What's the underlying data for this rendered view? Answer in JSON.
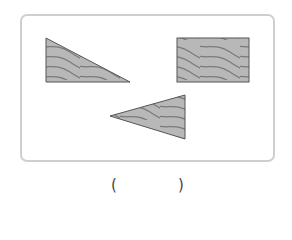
{
  "figure": {
    "shapes": [
      {
        "id": "shape-1",
        "kind": "right-triangle",
        "texture": "wood-grain"
      },
      {
        "id": "shape-2",
        "kind": "rectangle",
        "texture": "wood-grain"
      },
      {
        "id": "shape-3",
        "kind": "triangle",
        "texture": "wood-grain"
      }
    ],
    "colors": {
      "fill": "#b8b8b8",
      "grain": "#7a7a7a",
      "outline": "#555555",
      "frame": "#cfcfcf"
    }
  },
  "answer": {
    "left_paren": "(",
    "right_paren": ")",
    "value": ""
  }
}
